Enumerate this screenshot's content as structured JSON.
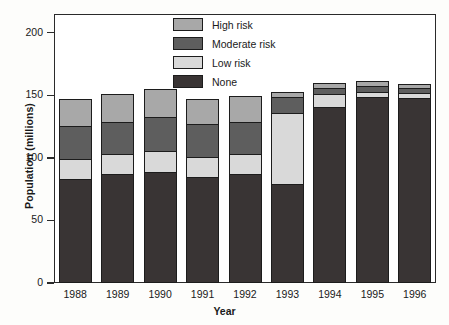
{
  "chart_data": {
    "type": "bar",
    "subtype": "stacked-bar",
    "title": "",
    "xlabel": "Year",
    "ylabel": "Population (millions)",
    "categories": [
      "1988",
      "1989",
      "1990",
      "1991",
      "1992",
      "1993",
      "1994",
      "1995",
      "1996"
    ],
    "ylim": [
      0,
      215
    ],
    "yticks": [
      0,
      50,
      100,
      150,
      200
    ],
    "ytick_labels": [
      "0",
      "50",
      "100",
      "150",
      "200"
    ],
    "grid": false,
    "legend_position": "top-center",
    "series": [
      {
        "name": "None",
        "color": "#393434",
        "values": [
          82,
          86,
          88,
          84,
          86,
          78,
          140,
          148,
          147
        ]
      },
      {
        "name": "Low risk",
        "color": "#d9d9d9",
        "values": [
          16,
          16,
          17,
          16,
          16,
          57,
          10,
          4,
          4
        ]
      },
      {
        "name": "Moderate risk",
        "color": "#5e5e5e",
        "values": [
          27,
          26,
          27,
          26,
          26,
          13,
          5,
          5,
          4
        ]
      },
      {
        "name": "High risk",
        "color": "#a8a8a8",
        "values": [
          21,
          22,
          22,
          20,
          21,
          4,
          4,
          4,
          3
        ]
      }
    ],
    "stack_order_bottom_to_top": [
      "None",
      "Low risk",
      "Moderate risk",
      "High risk"
    ],
    "totals": [
      146,
      150,
      154,
      146,
      149,
      152,
      159,
      161,
      158
    ]
  },
  "legend": {
    "items": [
      {
        "label": "High risk",
        "color": "#a8a8a8"
      },
      {
        "label": "Moderate risk",
        "color": "#5e5e5e"
      },
      {
        "label": "Low risk",
        "color": "#d9d9d9"
      },
      {
        "label": "None",
        "color": "#393434"
      }
    ]
  }
}
